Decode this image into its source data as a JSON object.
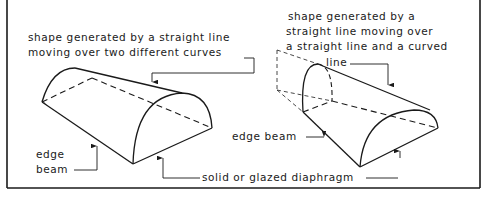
{
  "diagram": {
    "left_figure": {
      "caption_line1": "shape  generated by a straight line",
      "caption_line2": "moving over two different curves",
      "label_edge_beam_1": "edge",
      "label_edge_beam_2": "beam"
    },
    "right_figure": {
      "caption_line1": "shape generated by a",
      "caption_line2": "straight line moving over",
      "caption_line3": "a straight line and a curved",
      "caption_line4": "line",
      "label_edge_beam": "edge beam"
    },
    "shared_label": "solid or glazed diaphragm",
    "colors": {
      "stroke": "#1a1a1a",
      "background": "#ffffff"
    }
  }
}
